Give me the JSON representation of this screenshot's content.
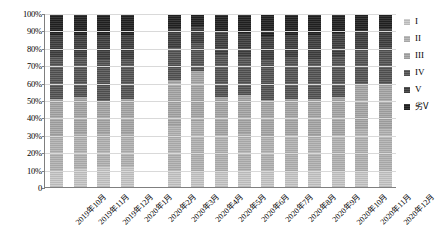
{
  "chart_data": {
    "type": "bar",
    "stacked": true,
    "stack_mode": "percent",
    "title": "",
    "subtitle": "",
    "xlabel": "",
    "ylabel": "",
    "ylim": [
      0,
      100
    ],
    "ytick_labels": [
      "100%",
      "90%",
      "80%",
      "70%",
      "60%",
      "50%",
      "40%",
      "30%",
      "20%",
      "10%",
      "0"
    ],
    "ytick_values": [
      100,
      90,
      80,
      70,
      60,
      50,
      40,
      30,
      20,
      10,
      0
    ],
    "grid": true,
    "legend_position": "right",
    "categories": [
      "2019年10月",
      "2019年11月",
      "2019年12月",
      "2020年1月",
      "2020年2月",
      "2020年3月",
      "2020年4月",
      "2020年5月",
      "2020年6月",
      "2020年7月",
      "2020年8月",
      "2020年9月",
      "2020年10月",
      "2020年11月",
      "2020年12月"
    ],
    "missing_categories": [
      "2020年2月"
    ],
    "series": [
      {
        "name": "I",
        "color": "#c4c4c4",
        "values": [
          10,
          11,
          12,
          12,
          null,
          10,
          9,
          9,
          10,
          10,
          9,
          10,
          9,
          9,
          9
        ]
      },
      {
        "name": "II",
        "color": "#b0b0b0",
        "values": [
          20,
          20,
          19,
          19,
          null,
          26,
          29,
          21,
          21,
          20,
          21,
          20,
          21,
          25,
          25
        ]
      },
      {
        "name": "III",
        "color": "#a4a4a4",
        "values": [
          21,
          21,
          18,
          20,
          null,
          26,
          29,
          22,
          22,
          20,
          21,
          21,
          22,
          25,
          25
        ]
      },
      {
        "name": "IV",
        "color": "#5c5c5c",
        "values": [
          24,
          23,
          25,
          23,
          null,
          19,
          16,
          25,
          23,
          24,
          24,
          23,
          24,
          21,
          22
        ]
      },
      {
        "name": "V",
        "color": "#464646",
        "values": [
          13,
          13,
          14,
          14,
          null,
          11,
          10,
          13,
          13,
          13,
          13,
          14,
          13,
          11,
          11
        ]
      },
      {
        "name": "劣V",
        "color": "#2b2b2b",
        "values": [
          12,
          12,
          12,
          12,
          null,
          8,
          7,
          10,
          11,
          13,
          12,
          12,
          11,
          9,
          8
        ]
      }
    ]
  },
  "legend": {
    "items": [
      {
        "label": "I",
        "swatch": "#c4c4c4"
      },
      {
        "label": "II",
        "swatch": "#b0b0b0"
      },
      {
        "label": "III",
        "swatch": "#a4a4a4"
      },
      {
        "label": "IV",
        "swatch": "#5c5c5c"
      },
      {
        "label": "V",
        "swatch": "#464646"
      },
      {
        "label": "劣V",
        "swatch": "#2b2b2b"
      }
    ]
  }
}
